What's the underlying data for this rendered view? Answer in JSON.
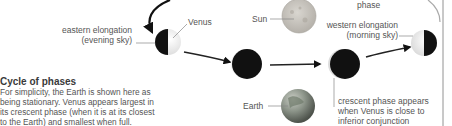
{
  "caption": {
    "title": "Cycle of phases",
    "lines": [
      "For simplicity, the Earth is shown here as",
      "being stationary. Venus appears largest in",
      "its crescent phase (when it is at its closest",
      "to the Earth) and smallest when full."
    ]
  },
  "labels": {
    "venus": "Venus",
    "sun": "Sun",
    "earth": "Earth",
    "phase_top": "phase",
    "eastern_elongation": "eastern elongation",
    "evening_sky": "(evening sky)",
    "western_elongation": "western elongation",
    "morning_sky": "(morning sky)",
    "crescent_1": "crescent phase appears",
    "crescent_2": "when Venus is close to",
    "crescent_3": "inferior conjunction"
  },
  "colors": {
    "background": "#ffffff",
    "planet_dark": "#111111",
    "planet_light": "#f2f2f2",
    "sun": "#c9c6c0",
    "earth": "#8a9186",
    "text": "#555555",
    "leader_line": "#888888"
  }
}
